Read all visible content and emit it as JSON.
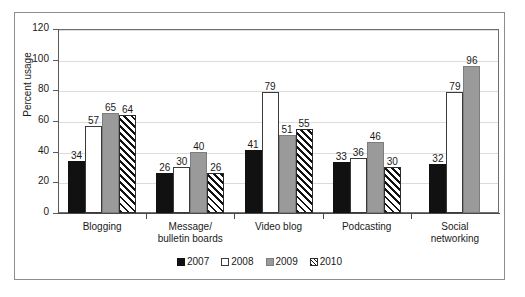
{
  "chart_data": {
    "type": "bar",
    "title": "",
    "xlabel": "",
    "ylabel": "Percent usage",
    "ylim": [
      0,
      120
    ],
    "ytick_step": 20,
    "yticks": [
      0,
      20,
      40,
      60,
      80,
      100,
      120
    ],
    "grid": true,
    "legend_position": "bottom-center",
    "categories": [
      "Blogging",
      "Message/\nbulletin boards",
      "Video blog",
      "Podcasting",
      "Social\nnetworking"
    ],
    "category_lines": [
      [
        "Blogging"
      ],
      [
        "Message/",
        "bulletin boards"
      ],
      [
        "Video blog"
      ],
      [
        "Podcasting"
      ],
      [
        "Social",
        "networking"
      ]
    ],
    "series": [
      {
        "name": "2007",
        "style": "solid-black",
        "color": "#111111",
        "values": [
          34,
          26,
          41,
          33,
          32
        ]
      },
      {
        "name": "2008",
        "style": "open-white",
        "color": "#ffffff",
        "values": [
          57,
          30,
          79,
          36,
          79
        ]
      },
      {
        "name": "2009",
        "style": "solid-gray",
        "color": "#9a9a9a",
        "values": [
          65,
          40,
          51,
          46,
          96
        ]
      },
      {
        "name": "2010",
        "style": "diagonal-hatch",
        "color": "#ffffff",
        "values": [
          64,
          26,
          55,
          30,
          null
        ]
      }
    ]
  },
  "legend": {
    "items": [
      {
        "label": "2007",
        "swatch": "y2007"
      },
      {
        "label": "2008",
        "swatch": "y2008"
      },
      {
        "label": "2009",
        "swatch": "y2009"
      },
      {
        "label": "2010",
        "swatch": "y2010"
      }
    ]
  }
}
